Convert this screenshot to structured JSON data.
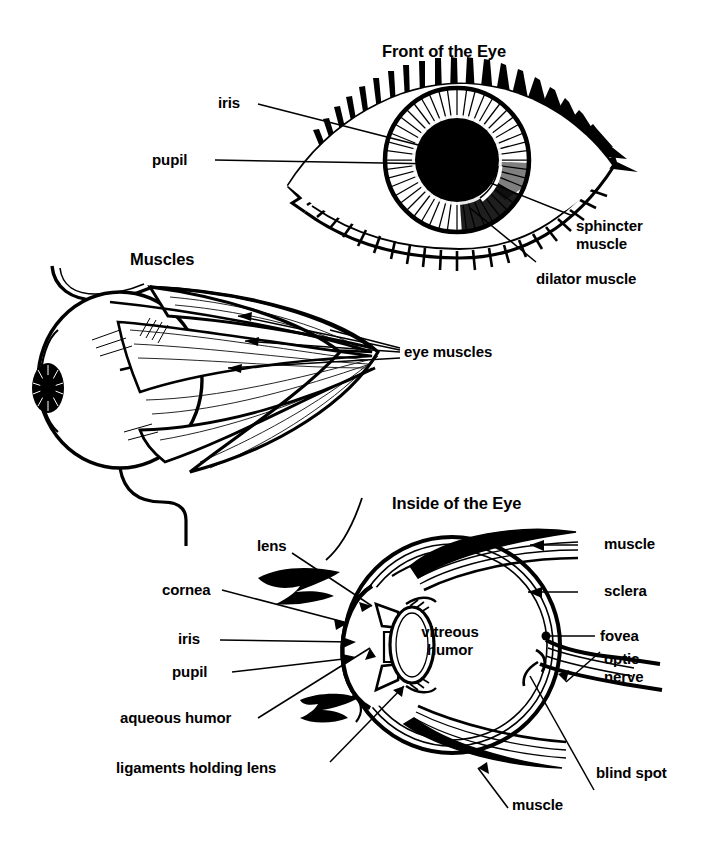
{
  "document": {
    "kind": "anatomical-diagram",
    "subject": "Human Eye",
    "panels": [
      "Front of the Eye",
      "Muscles",
      "Inside of the Eye"
    ]
  },
  "front_panel": {
    "title": "Front of the Eye",
    "labels": {
      "iris": "iris",
      "pupil": "pupil",
      "sphincter_muscle_line1": "sphincter",
      "sphincter_muscle_line2": "muscle",
      "dilator_muscle": "dilator muscle"
    }
  },
  "muscles_panel": {
    "title": "Muscles",
    "labels": {
      "eye_muscles": "eye muscles"
    }
  },
  "inside_panel": {
    "title": "Inside of the Eye",
    "labels": {
      "lens": "lens",
      "cornea": "cornea",
      "iris": "iris",
      "pupil": "pupil",
      "aqueous_humor": "aqueous humor",
      "ligaments": "ligaments holding lens",
      "vitreous_humor_line1": "vitreous",
      "vitreous_humor_line2": "humor",
      "muscle_top": "muscle",
      "sclera": "sclera",
      "fovea": "fovea",
      "optic_line1": "optic",
      "optic_line2": "nerve",
      "blind_spot": "blind spot",
      "muscle_bottom": "muscle"
    }
  },
  "colors": {
    "ink": "#000000",
    "paper": "#ffffff"
  }
}
